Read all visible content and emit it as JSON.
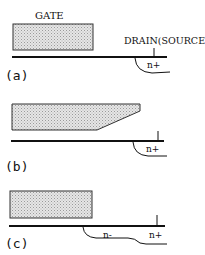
{
  "panel_a": {
    "label": "(a)",
    "gate_label": "GATE",
    "drain_label": "DRAIN(SOURCE)",
    "region_label": "n+"
  },
  "panel_b": {
    "label": "(b)",
    "region_label": "n+"
  },
  "panel_c": {
    "label": "(c)",
    "region_label_lightly_doped": "n-",
    "region_label": "n+"
  },
  "colors": {
    "line": "#111111",
    "gate_fill": "#d8d8d8",
    "gate_stroke": "#333333"
  }
}
